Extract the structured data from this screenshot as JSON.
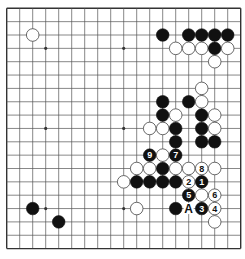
{
  "diagram": {
    "type": "go-board",
    "size": 19,
    "geometry": {
      "origin_x": 6.7,
      "origin_y": 8.3,
      "step_x": 13.0,
      "step_y": 13.35,
      "stone_radius": 6.3
    },
    "colors": {
      "background": "#ffffff",
      "line": "#555555",
      "border": "#333333",
      "black_stone": "#111111",
      "white_stone": "#ffffff",
      "white_stone_edge": "#444444",
      "label_on_black": "#ffffff",
      "label_on_white": "#111111",
      "marker_text": "#111111"
    },
    "star_points": [
      [
        3,
        3
      ],
      [
        9,
        3
      ],
      [
        15,
        3
      ],
      [
        3,
        9
      ],
      [
        9,
        9
      ],
      [
        15,
        9
      ],
      [
        3,
        15
      ],
      [
        9,
        15
      ],
      [
        15,
        15
      ]
    ],
    "stones": [
      {
        "color": "white",
        "col": 2,
        "row": 2
      },
      {
        "color": "black",
        "col": 12,
        "row": 2
      },
      {
        "color": "black",
        "col": 14,
        "row": 2
      },
      {
        "color": "black",
        "col": 15,
        "row": 2
      },
      {
        "color": "black",
        "col": 16,
        "row": 2
      },
      {
        "color": "black",
        "col": 17,
        "row": 2
      },
      {
        "color": "white",
        "col": 13,
        "row": 3
      },
      {
        "color": "white",
        "col": 14,
        "row": 3
      },
      {
        "color": "white",
        "col": 15,
        "row": 3
      },
      {
        "color": "black",
        "col": 16,
        "row": 3
      },
      {
        "color": "white",
        "col": 17,
        "row": 3
      },
      {
        "color": "white",
        "col": 16,
        "row": 4
      },
      {
        "color": "white",
        "col": 15,
        "row": 6
      },
      {
        "color": "black",
        "col": 12,
        "row": 7
      },
      {
        "color": "black",
        "col": 14,
        "row": 7
      },
      {
        "color": "white",
        "col": 15,
        "row": 7
      },
      {
        "color": "black",
        "col": 12,
        "row": 8
      },
      {
        "color": "white",
        "col": 13,
        "row": 8
      },
      {
        "color": "black",
        "col": 15,
        "row": 8
      },
      {
        "color": "white",
        "col": 16,
        "row": 8
      },
      {
        "color": "white",
        "col": 11,
        "row": 9
      },
      {
        "color": "white",
        "col": 12,
        "row": 9
      },
      {
        "color": "black",
        "col": 13,
        "row": 9
      },
      {
        "color": "black",
        "col": 15,
        "row": 9
      },
      {
        "color": "white",
        "col": 16,
        "row": 9
      },
      {
        "color": "black",
        "col": 13,
        "row": 10
      },
      {
        "color": "black",
        "col": 15,
        "row": 10
      },
      {
        "color": "black",
        "col": 16,
        "row": 10
      },
      {
        "color": "black",
        "col": 11,
        "row": 11,
        "label": "9"
      },
      {
        "color": "white",
        "col": 12,
        "row": 11
      },
      {
        "color": "black",
        "col": 13,
        "row": 11,
        "label": "7"
      },
      {
        "color": "white",
        "col": 10,
        "row": 12
      },
      {
        "color": "white",
        "col": 11,
        "row": 12
      },
      {
        "color": "black",
        "col": 12,
        "row": 12
      },
      {
        "color": "white",
        "col": 13,
        "row": 12
      },
      {
        "color": "white",
        "col": 14,
        "row": 12
      },
      {
        "color": "white",
        "col": 15,
        "row": 12,
        "label": "8"
      },
      {
        "color": "white",
        "col": 16,
        "row": 12
      },
      {
        "color": "white",
        "col": 9,
        "row": 13
      },
      {
        "color": "black",
        "col": 10,
        "row": 13
      },
      {
        "color": "black",
        "col": 11,
        "row": 13
      },
      {
        "color": "black",
        "col": 12,
        "row": 13
      },
      {
        "color": "black",
        "col": 13,
        "row": 13
      },
      {
        "color": "white",
        "col": 14,
        "row": 13,
        "label": "2"
      },
      {
        "color": "black",
        "col": 15,
        "row": 13,
        "label": "1"
      },
      {
        "color": "black",
        "col": 14,
        "row": 14,
        "label": "5"
      },
      {
        "color": "white",
        "col": 15,
        "row": 14
      },
      {
        "color": "white",
        "col": 16,
        "row": 14,
        "label": "6"
      },
      {
        "color": "black",
        "col": 2,
        "row": 15
      },
      {
        "color": "white",
        "col": 10,
        "row": 15
      },
      {
        "color": "black",
        "col": 13,
        "row": 15
      },
      {
        "color": "black",
        "col": 15,
        "row": 15,
        "label": "3"
      },
      {
        "color": "white",
        "col": 16,
        "row": 15,
        "label": "4"
      },
      {
        "color": "black",
        "col": 4,
        "row": 16
      },
      {
        "color": "white",
        "col": 16,
        "row": 16
      }
    ],
    "markers": [
      {
        "text": "A",
        "col": 14,
        "row": 15
      }
    ]
  }
}
